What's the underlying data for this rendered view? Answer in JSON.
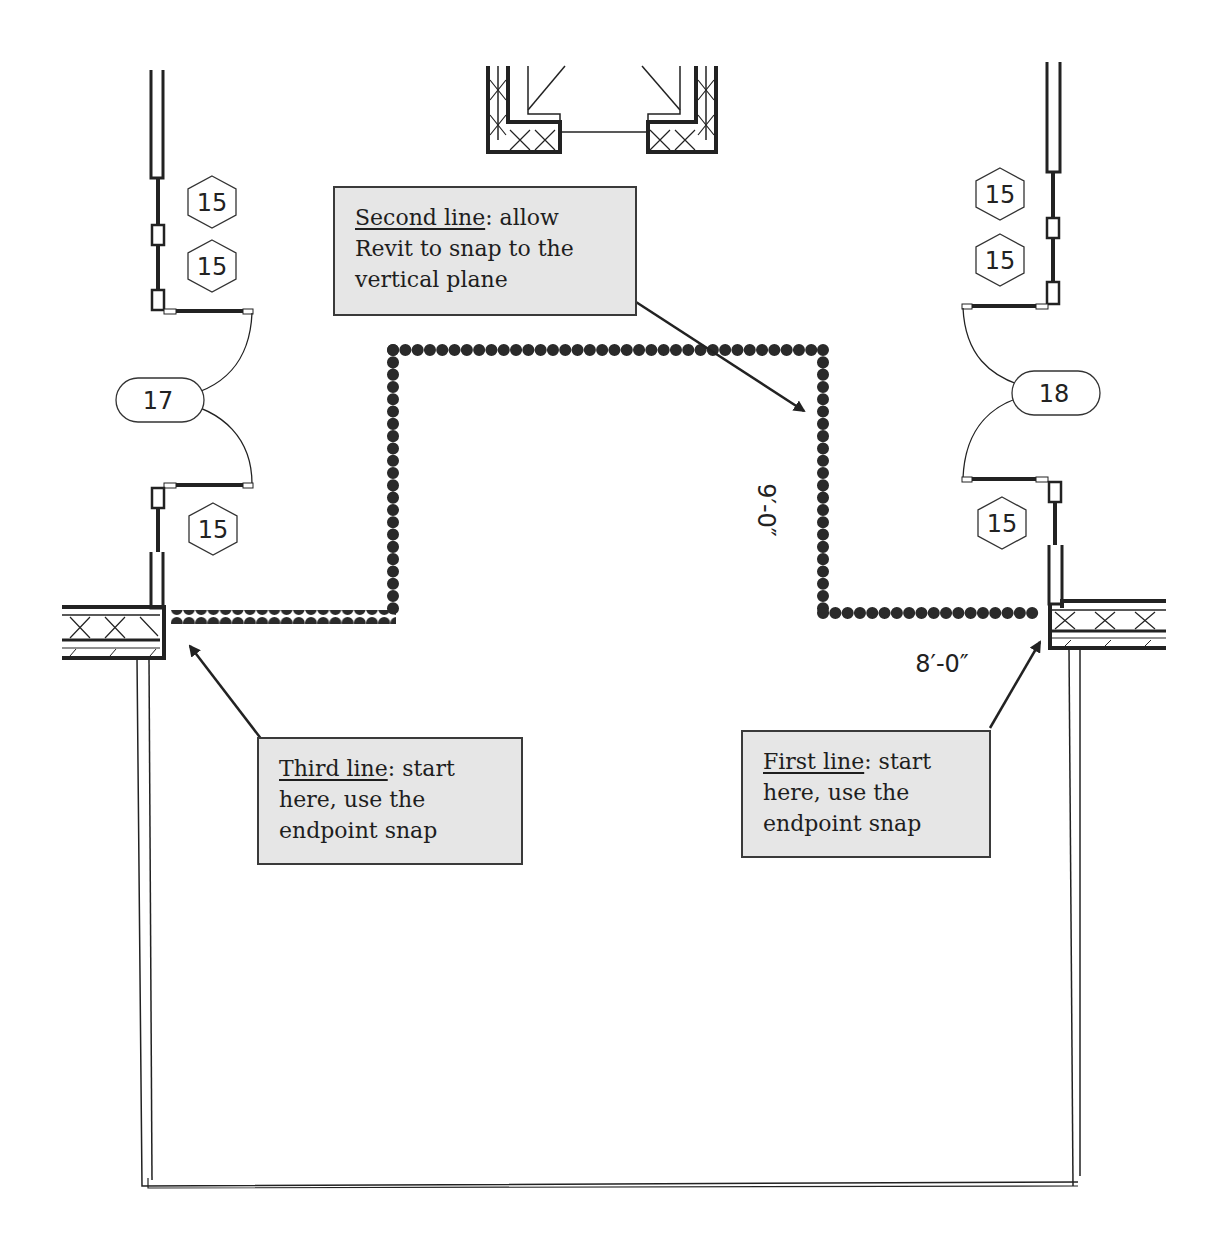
{
  "diagram": {
    "type": "revit-floor-plan-annotation",
    "colors": {
      "background": "#ffffff",
      "wall": "#222222",
      "sketch_line": "#2a2a2a",
      "callout_fill": "#e6e6e6",
      "callout_border": "#3a3a3a",
      "arrow": "#222222"
    },
    "callouts": [
      {
        "id": "second-line",
        "title": "Second line",
        "body_line1": ": allow",
        "body_line2": "Revit to snap to the",
        "body_line3": "vertical plane"
      },
      {
        "id": "third-line",
        "title": "Third line",
        "body_line1": ": start",
        "body_line2": "here, use the",
        "body_line3": "endpoint snap"
      },
      {
        "id": "first-line",
        "title": "First line",
        "body_line1": ": start",
        "body_line2": "here, use the",
        "body_line3": "endpoint snap"
      }
    ],
    "dimensions": {
      "vertical": "9′-0″",
      "horizontal": "8′-0″"
    },
    "window_tags": {
      "left": [
        "15",
        "15",
        "15"
      ],
      "right": [
        "15",
        "15",
        "15"
      ]
    },
    "door_tags": {
      "left": "17",
      "right": "18"
    }
  }
}
